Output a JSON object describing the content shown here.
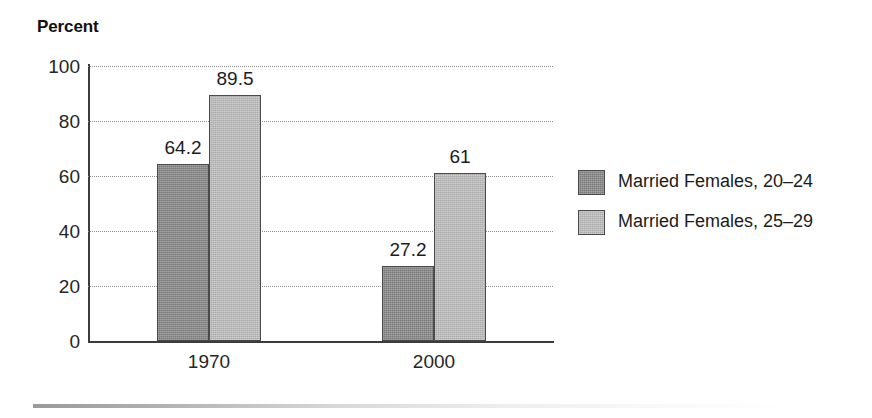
{
  "chart_data": {
    "type": "bar",
    "title": "Percent",
    "xlabel": "",
    "ylabel": "Percent",
    "categories": [
      "1970",
      "2000"
    ],
    "series": [
      {
        "name": "Married Females, 20–24",
        "values": [
          64.2,
          27.2
        ],
        "value_labels": [
          "64.2",
          "27.2"
        ],
        "color": "#8d8d8d"
      },
      {
        "name": "Married Females, 25–29",
        "values": [
          89.5,
          61
        ],
        "value_labels": [
          "89.5",
          "61"
        ],
        "color": "#bcbcbc"
      }
    ],
    "ylim": [
      0,
      100
    ],
    "ytick_labels": [
      "100",
      "80",
      "60",
      "40",
      "20",
      "0"
    ],
    "ytick_values": [
      100,
      80,
      60,
      40,
      20,
      0
    ],
    "grid": "horizontal-dotted",
    "legend_position": "right"
  },
  "legend": {
    "items": [
      {
        "label": "Married Females, 20–24",
        "swatch": "dark-gray-swatch"
      },
      {
        "label": "Married Females, 25–29",
        "swatch": "light-gray-swatch"
      }
    ]
  },
  "colors": {
    "series_a": "#8d8d8d",
    "series_b": "#bcbcbc",
    "axis": "#3c3c3c",
    "gridline": "#8e8e8e",
    "text": "#1c1c1c",
    "background": "#ffffff"
  }
}
